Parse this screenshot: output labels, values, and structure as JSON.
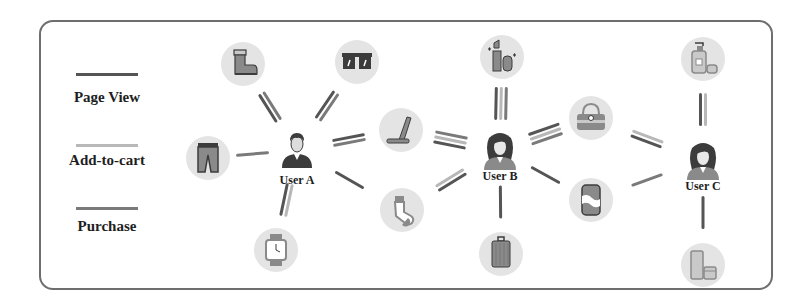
{
  "legend": {
    "items": [
      {
        "label": "Page View",
        "color": "#555555"
      },
      {
        "label": "Add-to-cart",
        "color": "#b8b8b8"
      },
      {
        "label": "Purchase",
        "color": "#7a7a7a"
      }
    ]
  },
  "users": [
    {
      "id": "A",
      "label": "User A",
      "x": 297,
      "y": 150,
      "gender": "male"
    },
    {
      "id": "B",
      "label": "User B",
      "x": 500,
      "y": 150,
      "gender": "female"
    },
    {
      "id": "C",
      "label": "User C",
      "x": 703,
      "y": 160,
      "gender": "female"
    }
  ],
  "items": [
    {
      "id": "boot",
      "name": "boot",
      "x": 243,
      "y": 64
    },
    {
      "id": "sunglasses",
      "name": "sunglasses",
      "x": 357,
      "y": 62
    },
    {
      "id": "pants",
      "name": "pants",
      "x": 208,
      "y": 158
    },
    {
      "id": "watch",
      "name": "watch",
      "x": 276,
      "y": 250
    },
    {
      "id": "laptop",
      "name": "laptop",
      "x": 401,
      "y": 130
    },
    {
      "id": "sock",
      "name": "sock",
      "x": 402,
      "y": 210
    },
    {
      "id": "lipstick",
      "name": "lipstick",
      "x": 502,
      "y": 57
    },
    {
      "id": "luggage",
      "name": "luggage",
      "x": 501,
      "y": 254
    },
    {
      "id": "handbag",
      "name": "handbag",
      "x": 591,
      "y": 118
    },
    {
      "id": "soda-can",
      "name": "soda-can",
      "x": 591,
      "y": 200
    },
    {
      "id": "lotion",
      "name": "lotion",
      "x": 703,
      "y": 59
    },
    {
      "id": "cream",
      "name": "cream",
      "x": 703,
      "y": 265
    }
  ],
  "edges": [
    {
      "user": "A",
      "item": "boot",
      "types": [
        "page_view",
        "purchase"
      ]
    },
    {
      "user": "A",
      "item": "sunglasses",
      "types": [
        "page_view",
        "purchase"
      ]
    },
    {
      "user": "A",
      "item": "pants",
      "types": [
        "purchase"
      ]
    },
    {
      "user": "A",
      "item": "watch",
      "types": [
        "add_to_cart",
        "page_view"
      ]
    },
    {
      "user": "A",
      "item": "laptop",
      "types": [
        "page_view",
        "purchase"
      ]
    },
    {
      "user": "A",
      "item": "sock",
      "types": [
        "page_view"
      ]
    },
    {
      "user": "B",
      "item": "laptop",
      "types": [
        "page_view",
        "add_to_cart",
        "purchase"
      ]
    },
    {
      "user": "B",
      "item": "sock",
      "types": [
        "page_view",
        "add_to_cart"
      ]
    },
    {
      "user": "B",
      "item": "lipstick",
      "types": [
        "page_view",
        "add_to_cart",
        "purchase"
      ]
    },
    {
      "user": "B",
      "item": "luggage",
      "types": [
        "page_view"
      ]
    },
    {
      "user": "B",
      "item": "handbag",
      "types": [
        "page_view",
        "add_to_cart",
        "purchase"
      ]
    },
    {
      "user": "B",
      "item": "soda-can",
      "types": [
        "page_view"
      ]
    },
    {
      "user": "C",
      "item": "handbag",
      "types": [
        "page_view",
        "add_to_cart"
      ]
    },
    {
      "user": "C",
      "item": "soda-can",
      "types": [
        "purchase"
      ]
    },
    {
      "user": "C",
      "item": "lotion",
      "types": [
        "page_view",
        "add_to_cart"
      ]
    },
    {
      "user": "C",
      "item": "cream",
      "types": [
        "page_view"
      ]
    }
  ],
  "colors": {
    "page_view": "#555555",
    "add_to_cart": "#b8b8b8",
    "purchase": "#7a7a7a",
    "node_bg": "#e4e4e4",
    "frame": "#6e6e6e",
    "icon_dark": "#3c3c3c",
    "icon_mid": "#8a8a8a",
    "icon_light": "#c9c9c9"
  }
}
